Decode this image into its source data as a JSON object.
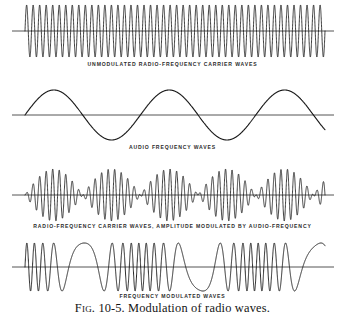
{
  "figure": {
    "caption_label": "Fig.",
    "caption_number": "10-5.",
    "caption_text": "Modulation of radio waves.",
    "caption_full": "Fig. 10-5. Modulation of radio waves.",
    "background_color": "#ffffff",
    "ink_color": "#1a1a1a",
    "axis_color": "#555555",
    "caption_color": "#2b2b2b"
  },
  "panels": [
    {
      "id": "unmodulated-carrier",
      "caption": "UNMODULATED  RADIO-FREQUENCY  CARRIER  WAVES"
    },
    {
      "id": "audio-frequency",
      "caption": "AUDIO  FREQUENCY  WAVES"
    },
    {
      "id": "amplitude-modulated",
      "caption": "RADIO-FREQUENCY CARRIER WAVES, AMPLITUDE MODULATED BY AUDIO-FREQUENCY"
    },
    {
      "id": "frequency-modulated",
      "caption": "FREQUENCY MODULATED WAVES"
    }
  ],
  "chart_data": [
    {
      "type": "line",
      "name": "unmodulated-carrier",
      "title": "UNMODULATED  RADIO-FREQUENCY  CARRIER  WAVES",
      "xlabel": "",
      "ylabel": "",
      "x_range": [
        0,
        1
      ],
      "ylim": [
        -1,
        1
      ],
      "grid": false,
      "legend": null,
      "waveform": "sine",
      "cycles": 46,
      "amplitude": 1.0,
      "phase_deg": 0,
      "baseline": 0,
      "description": "Constant-amplitude, constant-frequency radio-frequency carrier"
    },
    {
      "type": "line",
      "name": "audio-frequency",
      "title": "AUDIO  FREQUENCY  WAVES",
      "xlabel": "",
      "ylabel": "",
      "x_range": [
        0,
        1
      ],
      "ylim": [
        -1,
        1
      ],
      "grid": false,
      "legend": null,
      "waveform": "sine",
      "cycles": 2.6,
      "amplitude": 1.0,
      "phase_deg": 0,
      "baseline": 0,
      "description": "Low-frequency audio modulating signal, smooth sine"
    },
    {
      "type": "line",
      "name": "amplitude-modulated",
      "title": "RADIO-FREQUENCY CARRIER WAVES, AMPLITUDE MODULATED BY AUDIO-FREQUENCY",
      "xlabel": "",
      "ylabel": "",
      "x_range": [
        0,
        1
      ],
      "ylim": [
        -1,
        1
      ],
      "grid": false,
      "legend": null,
      "waveform": "amplitude-modulated-sine",
      "carrier_cycles": 46,
      "envelope_cycles": 2.6,
      "modulation_index": 1.0,
      "amplitude": 1.0,
      "baseline": 0,
      "description": "Carrier whose amplitude follows the audio sine envelope, with nodes where envelope crosses zero"
    },
    {
      "type": "line",
      "name": "frequency-modulated",
      "title": "FREQUENCY MODULATED WAVES",
      "xlabel": "",
      "ylabel": "",
      "x_range": [
        0,
        1
      ],
      "ylim": [
        -1,
        1
      ],
      "grid": false,
      "legend": null,
      "waveform": "frequency-modulated-sine",
      "carrier_cycles": 22,
      "modulating_cycles": 2.6,
      "frequency_deviation_ratio": 0.85,
      "amplitude": 1.0,
      "baseline": 0,
      "description": "Constant-amplitude carrier whose frequency is compressed and expanded by the audio signal"
    }
  ]
}
